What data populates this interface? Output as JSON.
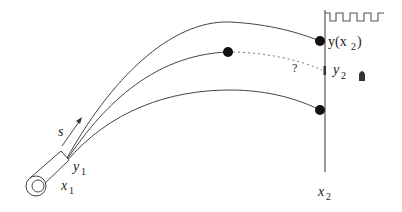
{
  "diagram": {
    "labels": {
      "s": "s",
      "y1": "y",
      "y1_sub": "1",
      "x1": "x",
      "x1_sub": "1",
      "x2": "x",
      "x2_sub": "2",
      "y_of_x2": "y(x",
      "y_of_x2_sub": "2",
      "y_of_x2_close": ")",
      "y2": "y",
      "y2_sub": "2",
      "question": "?"
    },
    "trajectories": [
      {
        "name": "upper",
        "end": "hits wall above target"
      },
      {
        "name": "middle",
        "end": "stops mid-air, dotted continuation to target"
      },
      {
        "name": "lower",
        "end": "hits wall below target"
      }
    ],
    "colors": {
      "stroke": "#333333",
      "dot": "#111111",
      "background": "#ffffff"
    }
  }
}
